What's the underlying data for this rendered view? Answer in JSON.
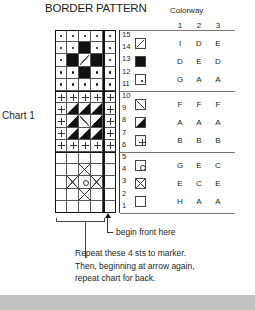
{
  "title": "BORDER PATTERN",
  "chart_label": "Chart 1",
  "colorway": {
    "label": "Colorway",
    "columns": [
      "1",
      "2",
      "3"
    ]
  },
  "chart": {
    "rows": 15,
    "stitches": 5,
    "repeat_stitches": 4,
    "row_numbers": [
      "15",
      "14",
      "13",
      "12",
      "11",
      "10",
      "9",
      "8",
      "7",
      "6",
      "5",
      "4",
      "3",
      "2",
      "1"
    ],
    "grid_top_to_bottom": [
      [
        "dot",
        "dot",
        "dot",
        "dot",
        "dot"
      ],
      [
        "dot",
        "dot",
        "black",
        "dot",
        "dot"
      ],
      [
        "dot",
        "black",
        "diag-back",
        "black",
        "dot"
      ],
      [
        "dot",
        "dot",
        "black",
        "dot",
        "dot"
      ],
      [
        "dot",
        "dot",
        "dot",
        "dot",
        "dot"
      ],
      [
        "plus",
        "plus",
        "plus",
        "plus",
        "plus"
      ],
      [
        "plus",
        "tri",
        "tri",
        "tri",
        "plus"
      ],
      [
        "plus",
        "tri",
        "diag-fwd",
        "tri",
        "plus"
      ],
      [
        "plus",
        "tri",
        "tri",
        "tri",
        "plus"
      ],
      [
        "plus",
        "plus",
        "plus",
        "plus",
        "plus"
      ],
      [
        "empty",
        "empty",
        "empty",
        "empty",
        "empty"
      ],
      [
        "empty",
        "empty",
        "cross",
        "empty",
        "empty"
      ],
      [
        "empty",
        "cross",
        "circle",
        "cross",
        "empty"
      ],
      [
        "empty",
        "empty",
        "cross",
        "empty",
        "empty"
      ],
      [
        "empty",
        "empty",
        "empty",
        "empty",
        "empty"
      ]
    ]
  },
  "legend": [
    {
      "symbol": "diagonal-back-icon",
      "values": [
        "I",
        "D",
        "E"
      ]
    },
    {
      "symbol": "solid-black-icon",
      "values": [
        "D",
        "E",
        "D"
      ]
    },
    {
      "symbol": "dot-icon",
      "values": [
        "G",
        "A",
        "A"
      ]
    },
    {
      "symbol": "diagonal-forward-icon",
      "values": [
        "F",
        "F",
        "F"
      ]
    },
    {
      "symbol": "half-triangle-icon",
      "values": [
        "A",
        "A",
        "A"
      ]
    },
    {
      "symbol": "plus-icon",
      "values": [
        "B",
        "B",
        "B"
      ]
    },
    {
      "symbol": "circle-icon",
      "values": [
        "G",
        "E",
        "C"
      ]
    },
    {
      "symbol": "cross-icon",
      "values": [
        "E",
        "C",
        "E"
      ]
    },
    {
      "symbol": "empty-square-icon",
      "values": [
        "H",
        "A",
        "A"
      ]
    }
  ],
  "annotations": {
    "begin": "begin front here",
    "note_lines": [
      "Repeat these 4 sts to marker.",
      "Then, beginning at arrow again,",
      "repeat chart for back."
    ]
  }
}
